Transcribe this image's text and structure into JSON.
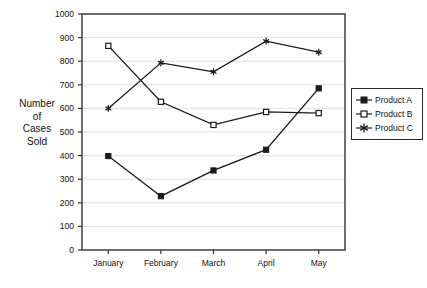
{
  "chart_data": {
    "type": "line",
    "title": "",
    "xlabel": "",
    "ylabel": "Number of Cases Sold",
    "categories": [
      "January",
      "February",
      "March",
      "April",
      "May"
    ],
    "series": [
      {
        "name": "Product A",
        "marker": "filled-square",
        "values": [
          398,
          228,
          337,
          425,
          685
        ]
      },
      {
        "name": "Product B",
        "marker": "open-square",
        "values": [
          865,
          628,
          530,
          585,
          580
        ]
      },
      {
        "name": "Product C",
        "marker": "star",
        "values": [
          600,
          793,
          755,
          885,
          838
        ]
      }
    ],
    "ylim": [
      0,
      1000
    ],
    "ytick_step": 100,
    "yticks": [
      0,
      100,
      200,
      300,
      400,
      500,
      600,
      700,
      800,
      900,
      1000
    ],
    "grid": true,
    "grid_axis": "y",
    "legend_position": "right",
    "line_color": "#1a1a1a",
    "grid_color": "#d8d8d8",
    "axis_color": "#333333",
    "background": "#ffffff"
  },
  "axis_title_lines": [
    "Number",
    "of",
    "Cases",
    "Sold"
  ],
  "legend": {
    "items": [
      {
        "label": "Product A"
      },
      {
        "label": "Product B"
      },
      {
        "label": "Product C"
      }
    ]
  }
}
